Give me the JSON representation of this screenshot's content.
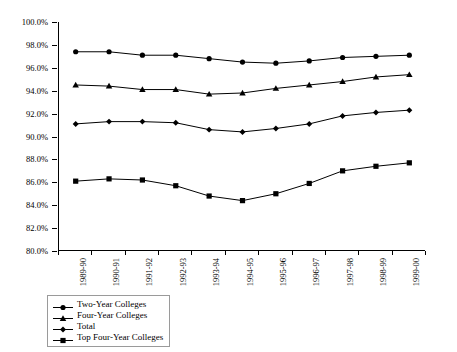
{
  "chart_data": {
    "type": "line",
    "title": "",
    "subtitle": "",
    "xlabel": "",
    "ylabel": "",
    "ylim": [
      80.0,
      100.0
    ],
    "ytick_step": 2.0,
    "ytick_labels": [
      "100.0%",
      "98.0%",
      "96.0%",
      "94.0%",
      "92.0%",
      "90.0%",
      "88.0%",
      "86.0%",
      "84.0%",
      "82.0%",
      "80.0%"
    ],
    "ytick_values": [
      100.0,
      98.0,
      96.0,
      94.0,
      92.0,
      90.0,
      88.0,
      86.0,
      84.0,
      82.0,
      80.0
    ],
    "value_suffix": "%",
    "grid": false,
    "legend_position": "bottom-left",
    "categories": [
      "1989-90",
      "1990-91",
      "1991-92",
      "1992-93",
      "1993-94",
      "1994-95",
      "1995-96",
      "1996-97",
      "1997-98",
      "1998-99",
      "1999-00"
    ],
    "series": [
      {
        "name": "Two-Year Colleges",
        "marker": "circle",
        "color": "#000000",
        "values": [
          97.4,
          97.4,
          97.1,
          97.1,
          96.8,
          96.5,
          96.4,
          96.6,
          96.9,
          97.0,
          97.1
        ]
      },
      {
        "name": "Four-Year Colleges",
        "marker": "triangle",
        "color": "#000000",
        "values": [
          94.5,
          94.4,
          94.1,
          94.1,
          93.7,
          93.8,
          94.2,
          94.5,
          94.8,
          95.2,
          95.4
        ]
      },
      {
        "name": "Total",
        "marker": "diamond",
        "color": "#000000",
        "values": [
          91.1,
          91.3,
          91.3,
          91.2,
          90.6,
          90.4,
          90.7,
          91.1,
          91.8,
          92.1,
          92.3
        ]
      },
      {
        "name": "Top Four-Year Colleges",
        "marker": "square",
        "color": "#000000",
        "values": [
          86.1,
          86.3,
          86.2,
          85.7,
          84.8,
          84.4,
          85.0,
          85.9,
          87.0,
          87.4,
          87.7
        ]
      }
    ]
  },
  "legend": {
    "items": [
      {
        "label": "Two-Year Colleges"
      },
      {
        "label": "Four-Year Colleges"
      },
      {
        "label": "Total"
      },
      {
        "label": "Top Four-Year Colleges"
      }
    ]
  }
}
